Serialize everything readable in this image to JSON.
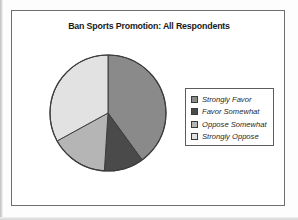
{
  "figure": {
    "title": "Ban Sports Promotion: All Respondents"
  },
  "legend": {
    "items": [
      {
        "label": "Strongly Favor",
        "color": "#8a8a8a"
      },
      {
        "label": "Favor Somewhat",
        "color": "#4a4a4a"
      },
      {
        "label": "Oppose Somewhat",
        "color": "#b5b5b5"
      },
      {
        "label": "Strongly Oppose",
        "color": "#e2e2e2"
      }
    ]
  },
  "chart_data": {
    "type": "pie",
    "title": "Ban Sports Promotion: All Respondents",
    "xlabel": "",
    "ylabel": "",
    "legend_position": "right",
    "start_angle_deg": 0,
    "direction": "clockwise",
    "categories": [
      "Strongly Favor",
      "Favor Somewhat",
      "Oppose Somewhat",
      "Strongly Oppose"
    ],
    "values": [
      40,
      11,
      16,
      33
    ],
    "value_unit": "percent",
    "colors": [
      "#8a8a8a",
      "#4a4a4a",
      "#b5b5b5",
      "#e2e2e2"
    ],
    "slice_border_color": "#3d3d3d",
    "data_labels_shown": false,
    "grid": false
  }
}
